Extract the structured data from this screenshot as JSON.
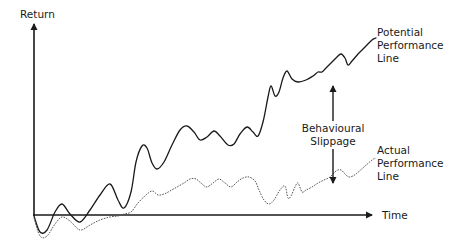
{
  "chart_data": {
    "type": "line",
    "title": "",
    "xlabel": "Time",
    "ylabel": "Return",
    "grid": false,
    "legend": "inline labels at line ends",
    "series": [
      {
        "name": "Potential Performance Line",
        "style": "solid",
        "color": "#1a1a1a",
        "points": [
          [
            34,
            216
          ],
          [
            40,
            232
          ],
          [
            47,
            230
          ],
          [
            55,
            212
          ],
          [
            62,
            204
          ],
          [
            70,
            214
          ],
          [
            80,
            222
          ],
          [
            90,
            210
          ],
          [
            100,
            195
          ],
          [
            110,
            184
          ],
          [
            118,
            200
          ],
          [
            124,
            208
          ],
          [
            131,
            192
          ],
          [
            136,
            162
          ],
          [
            142,
            146
          ],
          [
            147,
            148
          ],
          [
            152,
            163
          ],
          [
            157,
            169
          ],
          [
            164,
            162
          ],
          [
            172,
            145
          ],
          [
            180,
            130
          ],
          [
            187,
            126
          ],
          [
            194,
            132
          ],
          [
            200,
            140
          ],
          [
            207,
            137
          ],
          [
            214,
            131
          ],
          [
            220,
            136
          ],
          [
            228,
            145
          ],
          [
            234,
            144
          ],
          [
            240,
            134
          ],
          [
            247,
            127
          ],
          [
            253,
            132
          ],
          [
            258,
            136
          ],
          [
            263,
            122
          ],
          [
            268,
            97
          ],
          [
            271,
            86
          ],
          [
            275,
            96
          ],
          [
            279,
            92
          ],
          [
            283,
            78
          ],
          [
            287,
            71
          ],
          [
            292,
            79
          ],
          [
            298,
            82
          ],
          [
            306,
            80
          ],
          [
            313,
            76
          ],
          [
            318,
            72
          ],
          [
            322,
            72
          ],
          [
            326,
            68
          ],
          [
            333,
            61
          ],
          [
            337,
            57
          ],
          [
            341,
            54
          ],
          [
            345,
            58
          ],
          [
            348,
            65
          ],
          [
            352,
            61
          ],
          [
            358,
            54
          ],
          [
            364,
            48
          ],
          [
            372,
            40
          ],
          [
            376,
            38
          ]
        ]
      },
      {
        "name": "Actual Performance Line",
        "style": "dotted",
        "color": "#555555",
        "points": [
          [
            34,
            218
          ],
          [
            40,
            236
          ],
          [
            47,
            236
          ],
          [
            55,
            224
          ],
          [
            62,
            217
          ],
          [
            70,
            221
          ],
          [
            80,
            230
          ],
          [
            90,
            225
          ],
          [
            100,
            220
          ],
          [
            110,
            217
          ],
          [
            118,
            216
          ],
          [
            124,
            214
          ],
          [
            131,
            212
          ],
          [
            138,
            203
          ],
          [
            145,
            196
          ],
          [
            152,
            191
          ],
          [
            158,
            195
          ],
          [
            164,
            194
          ],
          [
            170,
            191
          ],
          [
            177,
            187
          ],
          [
            184,
            183
          ],
          [
            190,
            179
          ],
          [
            196,
            179
          ],
          [
            202,
            184
          ],
          [
            207,
            187
          ],
          [
            213,
            183
          ],
          [
            219,
            179
          ],
          [
            225,
            183
          ],
          [
            231,
            187
          ],
          [
            237,
            182
          ],
          [
            243,
            178
          ],
          [
            249,
            177
          ],
          [
            255,
            181
          ],
          [
            259,
            190
          ],
          [
            264,
            200
          ],
          [
            269,
            204
          ],
          [
            274,
            200
          ],
          [
            280,
            190
          ],
          [
            285,
            186
          ],
          [
            288,
            198
          ],
          [
            291,
            196
          ],
          [
            295,
            187
          ],
          [
            298,
            183
          ],
          [
            302,
            192
          ],
          [
            306,
            190
          ],
          [
            312,
            187
          ],
          [
            318,
            183
          ],
          [
            324,
            180
          ],
          [
            330,
            177
          ],
          [
            336,
            171
          ],
          [
            341,
            170
          ],
          [
            346,
            175
          ],
          [
            350,
            177
          ],
          [
            356,
            174
          ],
          [
            364,
            167
          ],
          [
            372,
            160
          ],
          [
            376,
            158
          ]
        ]
      }
    ],
    "annotations": [
      {
        "text": "Behavioural Slippage",
        "type": "double-arrow",
        "x": 333,
        "from_y": 84,
        "to_y": 185
      }
    ],
    "axes": {
      "origin": [
        34,
        215
      ],
      "y_axis_top": 22,
      "x_axis_right": 375
    }
  },
  "labels": {
    "y_axis": "Return",
    "x_axis": "Time",
    "potential": [
      "Potential",
      "Performance",
      "Line"
    ],
    "slippage": [
      "Behavioural",
      "Slippage"
    ],
    "actual": [
      "Actual",
      "Performance",
      "Line"
    ]
  },
  "colors": {
    "axis": "#1a1a1a",
    "potential_line": "#1a1a1a",
    "actual_line": "#555555",
    "background": "#ffffff"
  }
}
